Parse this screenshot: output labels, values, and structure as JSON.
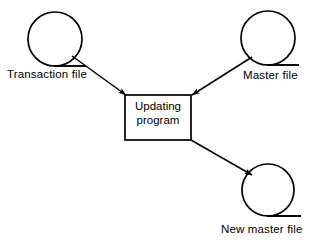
{
  "diagram": {
    "type": "system-flowchart",
    "colors": {
      "stroke": "#000000",
      "background": "#ffffff",
      "text": "#000000"
    },
    "process": {
      "shape": "rectangle",
      "label_line1": "Updating",
      "label_line2": "program",
      "x": 125,
      "y": 95,
      "width": 66,
      "height": 45
    },
    "nodes": [
      {
        "id": "transaction-file",
        "shape": "magnetic-tape",
        "label": "Transaction file",
        "cx": 55,
        "cy": 39,
        "r": 27
      },
      {
        "id": "master-file",
        "shape": "magnetic-tape",
        "label": "Master file",
        "cx": 268,
        "cy": 38,
        "r": 27
      },
      {
        "id": "new-master-file",
        "shape": "magnetic-tape",
        "label": "New master file",
        "cx": 268,
        "cy": 190,
        "r": 26
      }
    ],
    "arrows": [
      {
        "id": "transaction-to-program",
        "from": "transaction-file",
        "to": "updating-program",
        "direction": "down-right"
      },
      {
        "id": "master-to-program",
        "from": "master-file",
        "to": "updating-program",
        "direction": "down-left"
      },
      {
        "id": "program-to-new-master",
        "from": "updating-program",
        "to": "new-master-file",
        "direction": "down-right"
      }
    ]
  }
}
